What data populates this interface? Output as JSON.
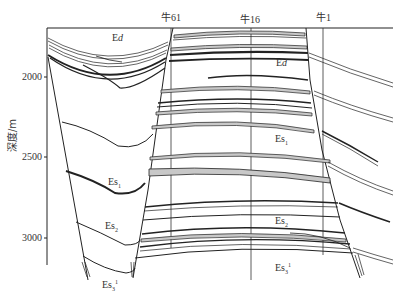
{
  "diagram": {
    "type": "geological cross-section",
    "y_axis": {
      "label": "深度/m",
      "ticks": [
        {
          "value": "2000",
          "y": 77
        },
        {
          "value": "2500",
          "y": 157
        },
        {
          "value": "3000",
          "y": 238
        }
      ]
    },
    "wells": [
      {
        "name": "牛61",
        "x": 171
      },
      {
        "name": "牛16",
        "x": 251
      },
      {
        "name": "牛1",
        "x": 323
      }
    ],
    "formations": [
      {
        "id": "ed_left",
        "base": "E",
        "sub": "d",
        "sup": "",
        "x": 112,
        "y": 33
      },
      {
        "id": "ed_center",
        "base": "E",
        "sub": "d",
        "sup": "",
        "x": 276,
        "y": 58
      },
      {
        "id": "es1_center",
        "base": "Es",
        "sub": "1",
        "sup": "",
        "x": 275,
        "y": 134
      },
      {
        "id": "es1_left",
        "base": "Es",
        "sub": "1",
        "sup": "",
        "x": 108,
        "y": 177
      },
      {
        "id": "es2_center",
        "base": "Es",
        "sub": "2",
        "sup": "",
        "x": 275,
        "y": 216
      },
      {
        "id": "es2_left",
        "base": "Es",
        "sub": "2",
        "sup": "",
        "x": 105,
        "y": 221
      },
      {
        "id": "es3_center",
        "base": "Es",
        "sub": "3",
        "sup": "1",
        "x": 275,
        "y": 262
      },
      {
        "id": "es3_left",
        "base": "Es",
        "sub": "3",
        "sup": "1",
        "x": 102,
        "y": 279
      }
    ],
    "colors": {
      "line": "#222222",
      "sand_fill": "#c8c8c8",
      "background": "#ffffff"
    }
  }
}
